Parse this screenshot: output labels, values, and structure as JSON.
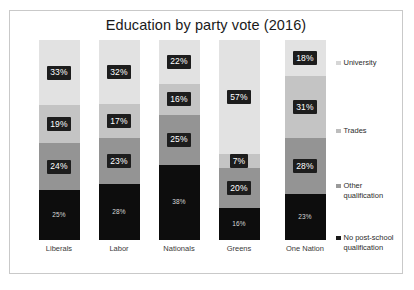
{
  "chart_data": {
    "type": "bar",
    "subtype": "stacked-100-percent",
    "orientation": "vertical",
    "title": "Education by party vote (2016)",
    "xlabel": "",
    "ylabel": "",
    "ylim": [
      0,
      100
    ],
    "grid": false,
    "legend_position": "right",
    "value_suffix": "%",
    "categories": [
      "Liberals",
      "Labor",
      "Nationals",
      "Greens",
      "One Nation"
    ],
    "series": [
      {
        "name": "University",
        "color": "#e2e2e2",
        "label_style": "boxed",
        "values": [
          33,
          32,
          22,
          57,
          18
        ],
        "labels": [
          "33%",
          "32%",
          "22%",
          "57%",
          "18%"
        ]
      },
      {
        "name": "Trades",
        "color": "#c4c4c4",
        "label_style": "boxed",
        "values": [
          19,
          17,
          16,
          7,
          31
        ],
        "labels": [
          "19%",
          "17%",
          "16%",
          "7%",
          "31%"
        ]
      },
      {
        "name": "Other qualification",
        "color": "#949494",
        "label_style": "boxed",
        "values": [
          24,
          23,
          25,
          20,
          28
        ],
        "labels": [
          "24%",
          "23%",
          "25%",
          "20%",
          "28%"
        ]
      },
      {
        "name": "No post-school qualification",
        "color": "#0d0d0d",
        "label_style": "plain",
        "values": [
          25,
          28,
          38,
          16,
          23
        ],
        "labels": [
          "25%",
          "28%",
          "38%",
          "16%",
          "23%"
        ]
      }
    ]
  },
  "legend": {
    "items": [
      {
        "label": "University",
        "color": "#d6d6d6"
      },
      {
        "label": "Trades",
        "color": "#bdbdbd"
      },
      {
        "label": "Other qualification",
        "color": "#9a9a9a"
      },
      {
        "label": "No post-school qualification",
        "color": "#1a1a1a"
      }
    ]
  },
  "frame": {
    "border_color": "#c9c9c9",
    "background_color": "#ffffff"
  }
}
